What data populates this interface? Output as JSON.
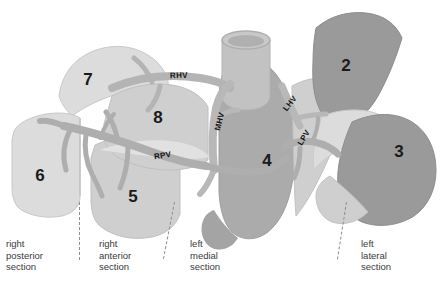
{
  "figure": {
    "background_color": "#ffffff"
  },
  "palette": {
    "light_gray": "#dcdcdc",
    "pale_gray": "#cfcfcf",
    "mid_light_gray": "#c2c2c2",
    "mid_gray": "#ababab",
    "dark_gray": "#9a9a9a",
    "vessel_gray": "#b4b4b4",
    "vessel_shadow": "#a0a0a0",
    "outline": "#bfbfbf",
    "text_dark": "#1a1a1a",
    "caption_text": "#3a3a3a",
    "divider": "#8e8e8e"
  },
  "segments": [
    {
      "id": "segment-7",
      "label": "7",
      "x": 88,
      "y": 85,
      "fill": "#dcdcdc"
    },
    {
      "id": "segment-6",
      "label": "6",
      "x": 40,
      "y": 181,
      "fill": "#dcdcdc"
    },
    {
      "id": "segment-5",
      "label": "5",
      "x": 133,
      "y": 202,
      "fill": "#cfcfcf"
    },
    {
      "id": "segment-8",
      "label": "8",
      "x": 158,
      "y": 123,
      "fill": "#cfcfcf"
    },
    {
      "id": "segment-4",
      "label": "4",
      "x": 267,
      "y": 166,
      "fill": "#ababab"
    },
    {
      "id": "segment-2",
      "label": "2",
      "x": 346,
      "y": 71,
      "fill": "#9a9a9a"
    },
    {
      "id": "segment-3",
      "label": "3",
      "x": 399,
      "y": 157,
      "fill": "#9a9a9a"
    }
  ],
  "vessels": [
    {
      "id": "rhv",
      "label": "RHV",
      "x": 179,
      "y": 78,
      "rotation": -2
    },
    {
      "id": "mhv",
      "label": "MHV",
      "x": 222,
      "y": 122,
      "rotation": -76
    },
    {
      "id": "rpv",
      "label": "RPV",
      "x": 163,
      "y": 158,
      "rotation": -9
    },
    {
      "id": "lhv",
      "label": "LHV",
      "x": 292,
      "y": 105,
      "rotation": -52
    },
    {
      "id": "lpv",
      "label": "LPV",
      "x": 306,
      "y": 139,
      "rotation": -58
    }
  ],
  "sections": [
    {
      "id": "right-posterior-section",
      "text": "right\nposterior\nsection",
      "x": 6,
      "y": 238
    },
    {
      "id": "right-anterior-section",
      "text": "right\nanterior\nsection",
      "x": 99,
      "y": 238
    },
    {
      "id": "left-medial-section",
      "text": "left\nmedial\nsection",
      "x": 190,
      "y": 238
    },
    {
      "id": "left-lateral-section",
      "text": "left\nlateral\nsection",
      "x": 361,
      "y": 238
    }
  ],
  "dividers": [
    {
      "id": "divider-right-posterior-anterior",
      "x": 79,
      "y": 202,
      "rotation": 0
    },
    {
      "id": "divider-right-anterior-left-medial",
      "x": 174,
      "y": 202,
      "rotation": 11
    },
    {
      "id": "divider-left-medial-lateral",
      "x": 346,
      "y": 202,
      "rotation": 9
    }
  ]
}
